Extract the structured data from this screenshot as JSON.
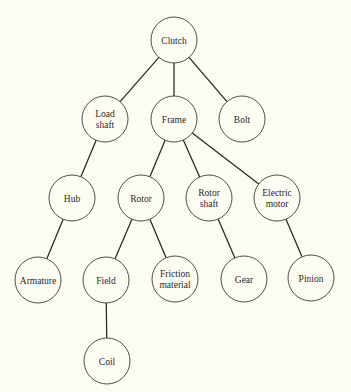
{
  "diagram": {
    "type": "tree",
    "title": "",
    "colors": {
      "background": "#fdfcf3",
      "stroke": "#2b2b2b",
      "text": "#2a2a2a"
    },
    "nodes": [
      {
        "id": "clutch",
        "lines": [
          "Clutch"
        ],
        "x": 174,
        "y": 40
      },
      {
        "id": "load-shaft",
        "lines": [
          "Load",
          "shaft"
        ],
        "x": 105,
        "y": 119
      },
      {
        "id": "frame",
        "lines": [
          "Frame"
        ],
        "x": 174,
        "y": 119
      },
      {
        "id": "bolt",
        "lines": [
          "Bolt"
        ],
        "x": 242,
        "y": 119
      },
      {
        "id": "hub",
        "lines": [
          "Hub"
        ],
        "x": 72,
        "y": 198
      },
      {
        "id": "rotor",
        "lines": [
          "Rotor"
        ],
        "x": 141,
        "y": 198
      },
      {
        "id": "rotor-shaft",
        "lines": [
          "Rotor",
          "shaft"
        ],
        "x": 209,
        "y": 198
      },
      {
        "id": "electric-motor",
        "lines": [
          "Electric",
          "motor"
        ],
        "x": 277,
        "y": 198
      },
      {
        "id": "armature",
        "lines": [
          "Armature"
        ],
        "x": 38,
        "y": 280
      },
      {
        "id": "field",
        "lines": [
          "Field"
        ],
        "x": 106,
        "y": 280
      },
      {
        "id": "friction-material",
        "lines": [
          "Friction",
          "material"
        ],
        "x": 175,
        "y": 279
      },
      {
        "id": "gear",
        "lines": [
          "Gear"
        ],
        "x": 244,
        "y": 279
      },
      {
        "id": "pinion",
        "lines": [
          "Pinion"
        ],
        "x": 311,
        "y": 278
      },
      {
        "id": "coil",
        "lines": [
          "Coil"
        ],
        "x": 107,
        "y": 361
      }
    ],
    "edges": [
      [
        "clutch",
        "load-shaft"
      ],
      [
        "clutch",
        "frame"
      ],
      [
        "clutch",
        "bolt"
      ],
      [
        "load-shaft",
        "hub"
      ],
      [
        "frame",
        "rotor"
      ],
      [
        "frame",
        "rotor-shaft"
      ],
      [
        "frame",
        "electric-motor"
      ],
      [
        "hub",
        "armature"
      ],
      [
        "rotor",
        "field"
      ],
      [
        "rotor",
        "friction-material"
      ],
      [
        "rotor-shaft",
        "gear"
      ],
      [
        "electric-motor",
        "pinion"
      ],
      [
        "field",
        "coil"
      ]
    ],
    "node_radius": 23
  }
}
